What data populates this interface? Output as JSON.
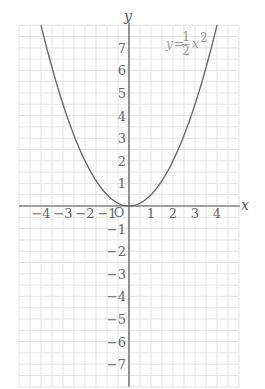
{
  "chart_data": {
    "type": "line",
    "title": "",
    "xlabel": "x",
    "ylabel": "y",
    "xlim": [
      -5,
      5
    ],
    "ylim": [
      -8,
      8
    ],
    "grid": true,
    "grid_step": 0.5,
    "origin_label": "O",
    "x_ticks": [
      -4,
      -3,
      -2,
      -1,
      1,
      2,
      3,
      4
    ],
    "x_tick_labels": [
      "−4",
      "−3",
      "−2",
      "−1",
      "1",
      "2",
      "3",
      "4"
    ],
    "y_ticks": [
      7,
      6,
      5,
      4,
      3,
      2,
      1,
      -1,
      -2,
      -3,
      -4,
      -5,
      -6,
      -7
    ],
    "y_tick_labels": [
      "7",
      "6",
      "5",
      "4",
      "3",
      "2",
      "1",
      "−1",
      "−2",
      "−3",
      "−4",
      "−5",
      "−6",
      "−7"
    ],
    "series": [
      {
        "name": "y = 1/2 x^2",
        "label_parts": {
          "lhs": "y",
          "eq": "=",
          "num": "1",
          "den": "2",
          "var": "x",
          "exp": "2"
        },
        "function": "0.5*x^2",
        "x": [
          -4,
          -3,
          -2,
          -1,
          0,
          1,
          2,
          3,
          4
        ],
        "values": [
          8,
          4.5,
          2,
          0.5,
          0,
          0.5,
          2,
          4.5,
          8
        ]
      }
    ]
  },
  "colors": {
    "grid": "#dcdcdc",
    "axis": "#555555",
    "curve": "#6a6a6a",
    "label": "#666666",
    "equation": "#9a9a9a"
  }
}
